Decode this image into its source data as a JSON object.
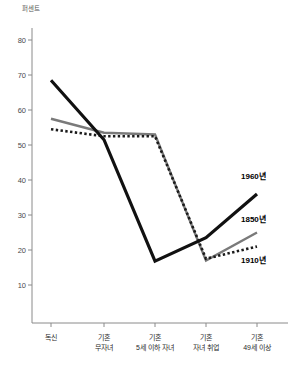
{
  "chart_data": {
    "type": "line",
    "title": "",
    "ylabel": "퍼센트",
    "xlabel": "",
    "ylim": [
      0,
      85
    ],
    "yticks": [
      10,
      20,
      30,
      40,
      50,
      60,
      70,
      80
    ],
    "grid": false,
    "legend_position": "inline-right-end",
    "categories": [
      "독신",
      "기혼\n무자녀",
      "기혼\n5세 이하 자녀",
      "기혼\n자녀 취업",
      "기혼\n49세 이상"
    ],
    "series": [
      {
        "name": "1850년",
        "color": "#7a7a7a",
        "style": "solid",
        "values": [
          57.5,
          53.5,
          53,
          17,
          25
        ]
      },
      {
        "name": "1910년",
        "color": "#1a1a1a",
        "style": "dotted",
        "values": [
          54.5,
          52.5,
          52.5,
          17.5,
          21
        ]
      },
      {
        "name": "1960년",
        "color": "#111111",
        "style": "solid-bold",
        "values": [
          68.5,
          51.5,
          16.8,
          23.5,
          36
        ]
      }
    ]
  },
  "axis": {
    "y_title": "퍼센트",
    "y_tick_labels": [
      "80",
      "70",
      "60",
      "50",
      "40",
      "30",
      "20",
      "10"
    ],
    "x_tick_labels": [
      "독신",
      "기혼\n무자녀",
      "기혼\n5세 이하 자녀",
      "기혼\n자녀 취업",
      "기혼\n49세 이상"
    ]
  },
  "series_labels": {
    "label_1960": "1960년",
    "label_1850": "1850년",
    "label_1910": "1910년"
  },
  "colors": {
    "series_1850": "#7a7a7a",
    "series_1910": "#1a1a1a",
    "series_1960": "#111111",
    "axis": "#8a8a8a",
    "background": "#ffffff"
  }
}
